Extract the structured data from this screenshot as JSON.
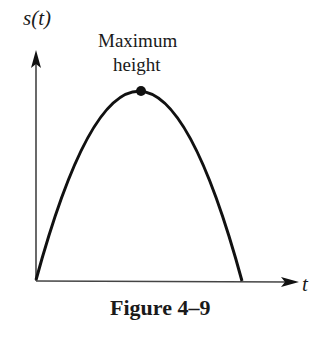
{
  "figure": {
    "y_axis_label": "s(t)",
    "x_axis_label": "t",
    "annotation_line1": "Maximum",
    "annotation_line2": "height",
    "caption": "Figure 4–9"
  },
  "colors": {
    "ink": "#1a1a1a",
    "background": "#ffffff"
  },
  "curve": {
    "type": "parabola",
    "start": [
      36,
      280
    ],
    "peak": [
      141,
      91
    ],
    "end": [
      242,
      281
    ]
  }
}
